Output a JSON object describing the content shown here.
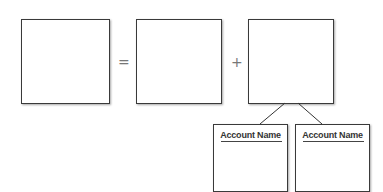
{
  "diagram": {
    "type": "accounting-equation-template",
    "operators": {
      "equals": "=",
      "plus": "+"
    },
    "boxes": [
      {
        "id": "box-left",
        "label": ""
      },
      {
        "id": "box-middle",
        "label": ""
      },
      {
        "id": "box-right",
        "label": ""
      }
    ],
    "sub_accounts": [
      {
        "title": "Account Name"
      },
      {
        "title": "Account Name"
      }
    ]
  }
}
